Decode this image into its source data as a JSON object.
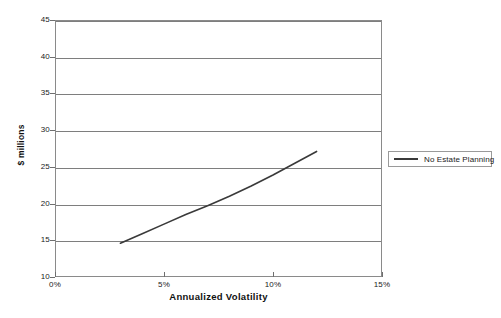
{
  "chart_data": {
    "type": "line",
    "title": "",
    "xlabel": "Annualized Volatility",
    "ylabel": "$ millions",
    "xlim": [
      0,
      15
    ],
    "ylim": [
      10,
      45
    ],
    "x_tick_labels": [
      "0%",
      "5%",
      "10%",
      "15%"
    ],
    "x_tick_values": [
      0,
      5,
      10,
      15
    ],
    "y_tick_labels": [
      "10",
      "15",
      "20",
      "25",
      "30",
      "35",
      "40",
      "45"
    ],
    "y_tick_values": [
      10,
      15,
      20,
      25,
      30,
      35,
      40,
      45
    ],
    "grid": "horizontal",
    "legend_position": "right",
    "series": [
      {
        "name": "No Estate Planning",
        "color": "#3a3a3a",
        "x": [
          3.0,
          4.0,
          5.0,
          6.0,
          7.0,
          8.0,
          9.0,
          10.0,
          11.0,
          12.0
        ],
        "values": [
          14.6,
          15.9,
          17.2,
          18.5,
          19.7,
          21.0,
          22.4,
          23.9,
          25.5,
          27.1
        ]
      }
    ]
  },
  "legend": {
    "entries": [
      {
        "label": "No Estate Planning"
      }
    ]
  },
  "axes": {
    "x_title": "Annualized Volatility",
    "y_title": "$ millions"
  }
}
